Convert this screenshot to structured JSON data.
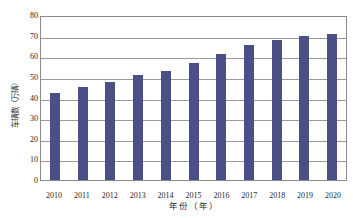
{
  "chart_data": {
    "type": "bar",
    "title": "",
    "xlabel": "年份（年）",
    "ylabel": "车辆数（万辆）",
    "categories": [
      "2010",
      "2011",
      "2012",
      "2013",
      "2014",
      "2015",
      "2016",
      "2017",
      "2018",
      "2019",
      "2020"
    ],
    "values": [
      42,
      45,
      47.5,
      51,
      53,
      56.5,
      61,
      65.5,
      68,
      70,
      71
    ],
    "series": [
      {
        "name": "车辆数",
        "values": [
          42,
          45,
          47.5,
          51,
          53,
          56.5,
          61,
          65.5,
          68,
          70,
          71
        ]
      }
    ],
    "ylim": [
      0,
      80
    ],
    "y_ticks": [
      0,
      10,
      20,
      30,
      40,
      50,
      60,
      70,
      80
    ],
    "y_tick_labels": [
      "0",
      "10",
      "20",
      "30",
      "40",
      "50",
      "60",
      "70",
      "80"
    ],
    "grid": true,
    "grid_axis": "y",
    "legend": false,
    "legend_position": "none",
    "bar_color": "#4a5085",
    "grid_color": "#9a9a9a",
    "axis_color": "#8a8a8a",
    "background": "#ffffff"
  }
}
